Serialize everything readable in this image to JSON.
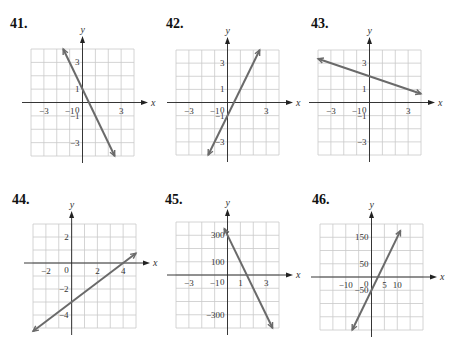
{
  "colors": {
    "grid": "#c9c9c9",
    "axis": "#222222",
    "line": "#6a6a6a",
    "text": "#333333"
  },
  "chart_data": [
    {
      "type": "line",
      "title": "41.",
      "xlabel": "x",
      "ylabel": "y",
      "xlim": [
        -4,
        4
      ],
      "ylim": [
        -4,
        4
      ],
      "x_ticks": [
        {
          "v": -3,
          "t": "−3"
        },
        {
          "v": -1,
          "t": "−1"
        },
        {
          "v": 3,
          "t": "3"
        }
      ],
      "y_ticks": [
        {
          "v": 3,
          "t": "3"
        },
        {
          "v": 1,
          "t": "1"
        },
        {
          "v": -1,
          "t": "−1"
        },
        {
          "v": -3,
          "t": "−3"
        }
      ],
      "origin_label": "0",
      "series": [
        {
          "name": "line",
          "x": [
            -1.5,
            2.5
          ],
          "y": [
            4,
            -4
          ]
        }
      ],
      "layout": {
        "left": 31,
        "top": 49,
        "width": 103,
        "height": 107,
        "num_x": 10,
        "num_y": 16
      }
    },
    {
      "type": "line",
      "title": "42.",
      "xlabel": "x",
      "ylabel": "y",
      "xlim": [
        -4,
        4
      ],
      "ylim": [
        -4,
        4
      ],
      "x_ticks": [
        {
          "v": -3,
          "t": "−3"
        },
        {
          "v": -1,
          "t": "−1"
        },
        {
          "v": 3,
          "t": "3"
        }
      ],
      "y_ticks": [
        {
          "v": 3,
          "t": "3"
        },
        {
          "v": 1,
          "t": "1"
        },
        {
          "v": -1,
          "t": "−1"
        },
        {
          "v": -3,
          "t": "−3"
        }
      ],
      "origin_label": "0",
      "series": [
        {
          "name": "line",
          "x": [
            -1.5,
            2.5
          ],
          "y": [
            -4,
            4
          ]
        }
      ],
      "layout": {
        "left": 176,
        "top": 50,
        "width": 103,
        "height": 105,
        "num_x": 166,
        "num_y": 16
      }
    },
    {
      "type": "line",
      "title": "43.",
      "xlabel": "x",
      "ylabel": "y",
      "xlim": [
        -4,
        4
      ],
      "ylim": [
        -4,
        4
      ],
      "x_ticks": [
        {
          "v": -3,
          "t": "−3"
        },
        {
          "v": -1,
          "t": "−1"
        },
        {
          "v": 3,
          "t": "3"
        }
      ],
      "y_ticks": [
        {
          "v": 3,
          "t": "3"
        },
        {
          "v": 1,
          "t": "1"
        },
        {
          "v": -1,
          "t": "−1"
        },
        {
          "v": -3,
          "t": "−3"
        }
      ],
      "origin_label": "0",
      "series": [
        {
          "name": "line",
          "x": [
            -4,
            4
          ],
          "y": [
            3.33,
            0.67
          ]
        }
      ],
      "layout": {
        "left": 318,
        "top": 50,
        "width": 103,
        "height": 105,
        "num_x": 311,
        "num_y": 16
      }
    },
    {
      "type": "line",
      "title": "44.",
      "xlabel": "x",
      "ylabel": "y",
      "xlim": [
        -3,
        5
      ],
      "ylim": [
        -5,
        3
      ],
      "x_ticks": [
        {
          "v": -2,
          "t": "−2"
        },
        {
          "v": 2,
          "t": "2"
        },
        {
          "v": 4,
          "t": "4"
        }
      ],
      "y_ticks": [
        {
          "v": 2,
          "t": "2"
        },
        {
          "v": -2,
          "t": "−2"
        },
        {
          "v": -4,
          "t": "−4"
        }
      ],
      "origin_label": "0",
      "series": [
        {
          "name": "line",
          "x": [
            -3,
            5
          ],
          "y": [
            -5.25,
            0.75
          ]
        }
      ],
      "layout": {
        "left": 33,
        "top": 224,
        "width": 103,
        "height": 104,
        "num_x": 12,
        "num_y": 192
      }
    },
    {
      "type": "line",
      "title": "45.",
      "xlabel": "x",
      "ylabel": "y",
      "xlim": [
        -4,
        4
      ],
      "ylim": [
        -400,
        400
      ],
      "x_ticks": [
        {
          "v": -3,
          "t": "−3"
        },
        {
          "v": -1,
          "t": "−1"
        },
        {
          "v": 1,
          "t": "1"
        },
        {
          "v": 3,
          "t": "3"
        }
      ],
      "y_ticks": [
        {
          "v": 300,
          "t": "300"
        },
        {
          "v": 100,
          "t": "100"
        },
        {
          "v": -300,
          "t": "−300"
        }
      ],
      "origin_label": "0",
      "series": [
        {
          "name": "line",
          "x": [
            -0.25,
            3.5
          ],
          "y": [
            350,
            -400
          ]
        }
      ],
      "layout": {
        "left": 176,
        "top": 222,
        "width": 103,
        "height": 106,
        "num_x": 165,
        "num_y": 192
      }
    },
    {
      "type": "line",
      "title": "46.",
      "xlabel": "x",
      "ylabel": "y",
      "xlim": [
        -20,
        20
      ],
      "ylim": [
        -200,
        200
      ],
      "x_ticks": [
        {
          "v": -10,
          "t": "−10"
        },
        {
          "v": 5,
          "t": "5"
        },
        {
          "v": 10,
          "t": "10"
        }
      ],
      "y_ticks": [
        {
          "v": 150,
          "t": "150"
        },
        {
          "v": 50,
          "t": "50"
        },
        {
          "v": -50,
          "t": "−50"
        }
      ],
      "origin_label": "0",
      "series": [
        {
          "name": "line",
          "x": [
            -7.5,
            11.25
          ],
          "y": [
            -200,
            175
          ]
        }
      ],
      "layout": {
        "left": 320,
        "top": 224,
        "width": 103,
        "height": 106,
        "num_x": 312,
        "num_y": 192
      }
    }
  ]
}
